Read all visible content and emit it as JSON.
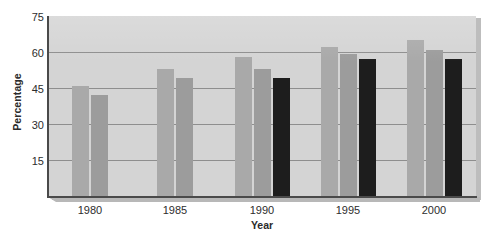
{
  "chart_data": {
    "type": "bar",
    "title": "",
    "subtitle": "",
    "xlabel": "Year",
    "ylabel": "Percentage",
    "categories": [
      "1980",
      "1985",
      "1990",
      "1995",
      "2000"
    ],
    "yticks": [
      75,
      60,
      45,
      30,
      15
    ],
    "ylim": [
      0,
      75
    ],
    "grid": true,
    "legend": "none",
    "series": [
      {
        "name": "series-1",
        "color": "#a9a9a9",
        "values": [
          46,
          53,
          58,
          62,
          65
        ]
      },
      {
        "name": "series-2",
        "color": "#9c9c9c",
        "values": [
          42,
          49,
          53,
          59,
          61
        ]
      },
      {
        "name": "series-3",
        "color": "#1d1d1d",
        "values": [
          null,
          null,
          49,
          57,
          57
        ]
      }
    ]
  },
  "axes": {
    "y_title": "Percentage",
    "x_title": "Year",
    "y_tick_labels": [
      "75",
      "60",
      "45",
      "30",
      "15"
    ],
    "x_tick_labels": [
      "1980",
      "1985",
      "1990",
      "1995",
      "2000"
    ]
  },
  "colors": {
    "plot_background": "#d4d4d4",
    "gridline": "#8e8e8e",
    "axis": "#4a4a4a",
    "series_1": "#a9a9a9",
    "series_2": "#9c9c9c",
    "series_3": "#1d1d1d",
    "text": "#2d2d2d"
  }
}
